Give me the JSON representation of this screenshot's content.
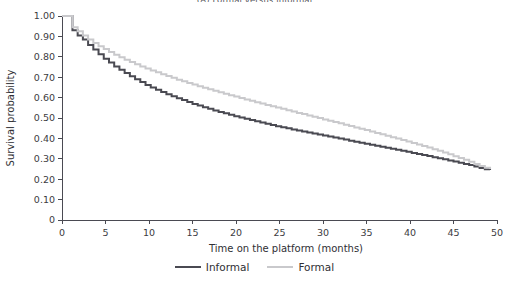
{
  "chart_data": {
    "type": "line",
    "title": "(A) Formal versus informal",
    "xlabel": "Time on the platform (months)",
    "ylabel": "Survival probability",
    "xlim": [
      0,
      50
    ],
    "ylim": [
      0,
      1.0
    ],
    "xticks": [
      0,
      5,
      10,
      15,
      20,
      25,
      30,
      35,
      40,
      45,
      50
    ],
    "xtick_labels": [
      "0",
      "5",
      "10",
      "15",
      "20",
      "25",
      "30",
      "35",
      "40",
      "45",
      "50"
    ],
    "yticks": [
      0,
      0.1,
      0.2,
      0.3,
      0.4,
      0.5,
      0.6,
      0.7,
      0.8,
      0.9,
      1.0
    ],
    "ytick_labels": [
      "0",
      "0.10",
      "0.20",
      "0.30",
      "0.40",
      "0.50",
      "0.60",
      "0.70",
      "0.80",
      "0.90",
      "1.00"
    ],
    "grid": false,
    "legend_position": "below",
    "step_style": "post",
    "series": [
      {
        "name": "Informal",
        "color": "#4a4a52",
        "line_width": 2.0,
        "x": [
          0,
          0.6,
          1.2,
          1.8,
          2.4,
          3.0,
          3.6,
          4.2,
          4.8,
          5.4,
          6.0,
          6.6,
          7.2,
          7.8,
          8.4,
          9.0,
          9.6,
          10.2,
          10.8,
          11.4,
          12.0,
          12.6,
          13.2,
          13.8,
          14.4,
          15.0,
          15.6,
          16.2,
          16.8,
          17.4,
          18.0,
          18.6,
          19.2,
          19.8,
          20.4,
          21.0,
          21.6,
          22.2,
          22.8,
          23.4,
          24.0,
          24.6,
          25.2,
          25.8,
          26.4,
          27.0,
          27.6,
          28.2,
          28.8,
          29.4,
          30.0,
          30.6,
          31.2,
          31.8,
          32.4,
          33.0,
          33.6,
          34.2,
          34.8,
          35.4,
          36.0,
          36.6,
          37.2,
          37.8,
          38.4,
          39.0,
          39.6,
          40.2,
          40.8,
          41.4,
          42.0,
          42.6,
          43.2,
          43.8,
          44.4,
          45.0,
          45.6,
          46.2,
          46.8,
          47.4,
          48.0,
          48.6,
          49.2
        ],
        "y": [
          1.0,
          1.0,
          0.93,
          0.905,
          0.885,
          0.858,
          0.836,
          0.812,
          0.79,
          0.772,
          0.753,
          0.737,
          0.72,
          0.705,
          0.69,
          0.676,
          0.662,
          0.65,
          0.639,
          0.628,
          0.617,
          0.607,
          0.597,
          0.588,
          0.578,
          0.569,
          0.561,
          0.553,
          0.545,
          0.537,
          0.53,
          0.523,
          0.516,
          0.509,
          0.502,
          0.496,
          0.49,
          0.484,
          0.478,
          0.472,
          0.466,
          0.46,
          0.455,
          0.45,
          0.444,
          0.439,
          0.434,
          0.429,
          0.424,
          0.419,
          0.414,
          0.409,
          0.404,
          0.399,
          0.394,
          0.389,
          0.384,
          0.379,
          0.374,
          0.369,
          0.364,
          0.359,
          0.354,
          0.349,
          0.344,
          0.339,
          0.334,
          0.329,
          0.324,
          0.319,
          0.314,
          0.308,
          0.303,
          0.298,
          0.292,
          0.287,
          0.281,
          0.275,
          0.269,
          0.262,
          0.255,
          0.249,
          0.245
        ]
      },
      {
        "name": "Formal",
        "color": "#c9c9cc",
        "line_width": 2.0,
        "x": [
          0,
          0.6,
          1.2,
          1.8,
          2.4,
          3.0,
          3.6,
          4.2,
          4.8,
          5.4,
          6.0,
          6.6,
          7.2,
          7.8,
          8.4,
          9.0,
          9.6,
          10.2,
          10.8,
          11.4,
          12.0,
          12.6,
          13.2,
          13.8,
          14.4,
          15.0,
          15.6,
          16.2,
          16.8,
          17.4,
          18.0,
          18.6,
          19.2,
          19.8,
          20.4,
          21.0,
          21.6,
          22.2,
          22.8,
          23.4,
          24.0,
          24.6,
          25.2,
          25.8,
          26.4,
          27.0,
          27.6,
          28.2,
          28.8,
          29.4,
          30.0,
          30.6,
          31.2,
          31.8,
          32.4,
          33.0,
          33.6,
          34.2,
          34.8,
          35.4,
          36.0,
          36.6,
          37.2,
          37.8,
          38.4,
          39.0,
          39.6,
          40.2,
          40.8,
          41.4,
          42.0,
          42.6,
          43.2,
          43.8,
          44.4,
          45.0,
          45.6,
          46.2,
          46.8,
          47.4,
          48.0,
          48.6,
          49.2
        ],
        "y": [
          1.0,
          1.0,
          0.945,
          0.925,
          0.905,
          0.885,
          0.868,
          0.852,
          0.838,
          0.824,
          0.81,
          0.798,
          0.786,
          0.775,
          0.764,
          0.753,
          0.743,
          0.733,
          0.724,
          0.715,
          0.706,
          0.697,
          0.688,
          0.68,
          0.672,
          0.664,
          0.656,
          0.648,
          0.641,
          0.633,
          0.626,
          0.619,
          0.612,
          0.605,
          0.598,
          0.591,
          0.584,
          0.577,
          0.571,
          0.564,
          0.558,
          0.551,
          0.545,
          0.538,
          0.532,
          0.525,
          0.519,
          0.512,
          0.506,
          0.5,
          0.493,
          0.487,
          0.48,
          0.474,
          0.467,
          0.461,
          0.454,
          0.447,
          0.441,
          0.434,
          0.427,
          0.42,
          0.413,
          0.406,
          0.399,
          0.392,
          0.385,
          0.378,
          0.37,
          0.363,
          0.355,
          0.347,
          0.339,
          0.331,
          0.322,
          0.313,
          0.304,
          0.295,
          0.285,
          0.275,
          0.265,
          0.256,
          0.25
        ]
      }
    ],
    "legend": [
      {
        "label": "Informal",
        "color": "#4a4a52"
      },
      {
        "label": "Formal",
        "color": "#c9c9cc"
      }
    ]
  }
}
